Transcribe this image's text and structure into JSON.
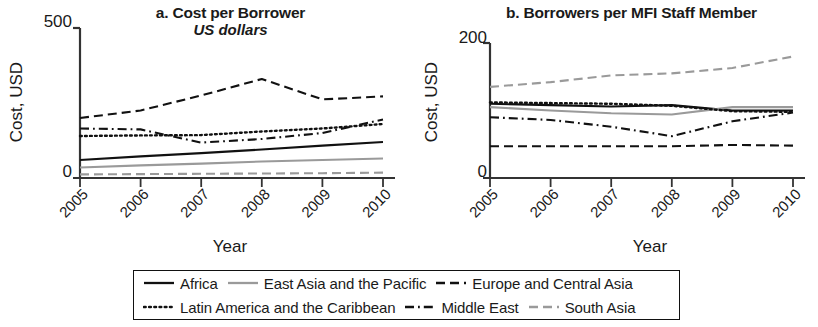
{
  "figure": {
    "panels": [
      {
        "id": "a",
        "title": "a. Cost per Borrower",
        "subtitle": "US dollars",
        "ylabel": "Cost, USD",
        "xlabel": "Year",
        "ytick_top": "500",
        "ytick_bottom": "0"
      },
      {
        "id": "b",
        "title": "b. Borrowers per MFI Staff Member",
        "subtitle": "",
        "ylabel": "Cost, USD",
        "xlabel": "Year",
        "ytick_top": "200",
        "ytick_bottom": "0"
      }
    ],
    "xticks": [
      "2005",
      "2006",
      "2007",
      "2008",
      "2009",
      "2010"
    ]
  },
  "legend": {
    "rows": [
      [
        {
          "label": "Africa",
          "style": "solid",
          "color": "#111111"
        },
        {
          "label": "East Asia and the Pacific",
          "style": "solid",
          "color": "#9a9a9a"
        },
        {
          "label": "Europe and Central Asia",
          "style": "dashed",
          "color": "#111111"
        }
      ],
      [
        {
          "label": "Latin America and the Caribbean",
          "style": "dotted",
          "color": "#111111"
        },
        {
          "label": "Middle East",
          "style": "dashdot",
          "color": "#111111"
        },
        {
          "label": "South Asia",
          "style": "dashed",
          "color": "#9a9a9a"
        }
      ]
    ]
  },
  "chart_data": [
    {
      "type": "line",
      "panel": "a",
      "title": "a. Cost per Borrower",
      "subtitle": "US dollars",
      "xlabel": "Year",
      "ylabel": "Cost, USD",
      "x": [
        "2005",
        "2006",
        "2007",
        "2008",
        "2009",
        "2010"
      ],
      "xlim": [
        2005,
        2010
      ],
      "ylim": [
        0,
        500
      ],
      "yticks": [
        0,
        500
      ],
      "grid": false,
      "legend_position": "below-figure",
      "series": [
        {
          "name": "Africa",
          "style": "solid",
          "color": "#111111",
          "values": [
            60,
            72,
            83,
            95,
            108,
            120
          ]
        },
        {
          "name": "East Asia and the Pacific",
          "style": "solid",
          "color": "#9a9a9a",
          "values": [
            35,
            42,
            48,
            55,
            60,
            65
          ]
        },
        {
          "name": "Europe and Central Asia",
          "style": "dashed",
          "color": "#111111",
          "values": [
            200,
            225,
            275,
            330,
            262,
            272
          ]
        },
        {
          "name": "Latin America and the Caribbean",
          "style": "dotted",
          "color": "#111111",
          "values": [
            140,
            142,
            143,
            155,
            165,
            180
          ]
        },
        {
          "name": "Middle East",
          "style": "dashdot",
          "color": "#111111",
          "values": [
            165,
            162,
            118,
            130,
            150,
            195
          ]
        },
        {
          "name": "South Asia",
          "style": "dashed",
          "color": "#9a9a9a",
          "values": [
            12,
            13,
            14,
            15,
            16,
            18
          ]
        }
      ]
    },
    {
      "type": "line",
      "panel": "b",
      "title": "b. Borrowers per MFI Staff Member",
      "subtitle": "",
      "xlabel": "Year",
      "ylabel": "Cost, USD",
      "x": [
        "2005",
        "2006",
        "2007",
        "2008",
        "2009",
        "2010"
      ],
      "xlim": [
        2005,
        2010
      ],
      "ylim": [
        0,
        200
      ],
      "yticks": [
        0,
        200
      ],
      "grid": false,
      "legend_position": "below-figure",
      "series": [
        {
          "name": "Africa",
          "style": "solid",
          "color": "#111111",
          "values": [
            110,
            108,
            106,
            108,
            100,
            100
          ]
        },
        {
          "name": "East Asia and the Pacific",
          "style": "solid",
          "color": "#9a9a9a",
          "values": [
            105,
            100,
            96,
            94,
            105,
            105
          ]
        },
        {
          "name": "Europe and Central Asia",
          "style": "dashed",
          "color": "#111111",
          "values": [
            47,
            47,
            47,
            47,
            49,
            48
          ]
        },
        {
          "name": "Latin America and the Caribbean",
          "style": "dotted",
          "color": "#111111",
          "values": [
            112,
            111,
            110,
            107,
            99,
            98
          ]
        },
        {
          "name": "Middle East",
          "style": "dashdot",
          "color": "#111111",
          "values": [
            90,
            86,
            76,
            62,
            84,
            97
          ]
        },
        {
          "name": "South Asia",
          "style": "dashed",
          "color": "#9a9a9a",
          "values": [
            135,
            142,
            152,
            155,
            163,
            180
          ]
        }
      ]
    }
  ]
}
